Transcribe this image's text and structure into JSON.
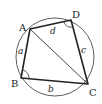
{
  "diagram": {
    "type": "cyclic-quadrilateral",
    "vertices": {
      "A": {
        "label": "A",
        "x": 30,
        "y": 29
      },
      "B": {
        "label": "B",
        "x": 21,
        "y": 78
      },
      "C": {
        "label": "C",
        "x": 88,
        "y": 84
      },
      "D": {
        "label": "D",
        "x": 71,
        "y": 20
      }
    },
    "sides": {
      "AB": {
        "label": "a"
      },
      "BC": {
        "label": "b"
      },
      "CD": {
        "label": "c"
      },
      "DA": {
        "label": "d"
      }
    },
    "diagonal": "AC",
    "angle_marks": [
      "B",
      "D"
    ],
    "circle": {
      "cx": 55,
      "cy": 57,
      "r": 39
    },
    "colors": {
      "stroke": "#222222",
      "background": "#ffffff"
    }
  }
}
